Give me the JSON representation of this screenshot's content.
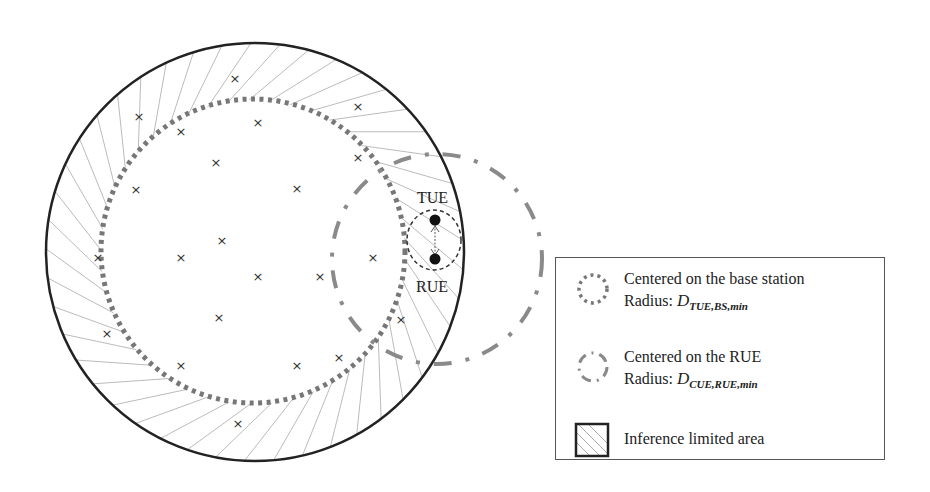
{
  "diagram": {
    "type": "network-coverage-diagram",
    "nodes": {
      "tue_label": "TUE",
      "rue_label": "RUE"
    },
    "ue_marker_symbol": "×",
    "ue_markers": [
      [
        235,
        79
      ],
      [
        139,
        117
      ],
      [
        258,
        123
      ],
      [
        181,
        132
      ],
      [
        358,
        107
      ],
      [
        216,
        163
      ],
      [
        358,
        158
      ],
      [
        297,
        189
      ],
      [
        136,
        190
      ],
      [
        222,
        241
      ],
      [
        181,
        258
      ],
      [
        98,
        258
      ],
      [
        258,
        277
      ],
      [
        320,
        277
      ],
      [
        373,
        258
      ],
      [
        401,
        320
      ],
      [
        219,
        318
      ],
      [
        107,
        334
      ],
      [
        181,
        366
      ],
      [
        297,
        366
      ],
      [
        339,
        358
      ],
      [
        238,
        424
      ]
    ],
    "colors": {
      "outer_circle": "#222222",
      "dotted_circle": "#777777",
      "dashdot_circle": "#8a8a8a",
      "hatch": "#bbbbbb",
      "node": "#111111"
    }
  },
  "legend": {
    "items": [
      {
        "icon": "dotted-circle-icon",
        "line1": "Centered on the base station",
        "radius_prefix": "Radius: ",
        "symbol": "D",
        "subscript": "TUE,BS,min"
      },
      {
        "icon": "dash-dot-circle-icon",
        "line1": "Centered on the RUE",
        "radius_prefix": "Radius: ",
        "symbol": "D",
        "subscript": "CUE,RUE,min"
      },
      {
        "icon": "hatched-square-icon",
        "line1": "Inference limited area"
      }
    ]
  }
}
